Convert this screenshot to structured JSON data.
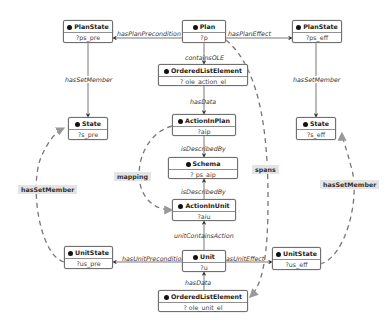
{
  "nodes": {
    "planstate_pre": {
      "title": "PlanState",
      "id": "?ps_pre"
    },
    "plan": {
      "title": "Plan",
      "id": "?p"
    },
    "planstate_eff": {
      "title": "PlanState",
      "id": "?ps_eff"
    },
    "ole_action": {
      "title": "OrderedListElement",
      "id": "? ole_action_el"
    },
    "state_pre": {
      "title": "State",
      "id": "?s_pre"
    },
    "action_in_plan": {
      "title": "ActionInPlan",
      "id": "?aip"
    },
    "state_eff": {
      "title": "State",
      "id": "?s_eff"
    },
    "schema": {
      "title": "Schema",
      "id": "? ps_aip"
    },
    "action_in_unit": {
      "title": "ActionInUnit",
      "id": "?aiu"
    },
    "unitstate_pre": {
      "title": "UnitState",
      "id": "?us_pre"
    },
    "unit": {
      "title": "Unit",
      "id": "?u"
    },
    "unitstate_eff": {
      "title": "UnitState",
      "id": "?us_eff"
    },
    "ole_unit": {
      "title": "OrderedListElement",
      "id": "? ole_unit_el"
    }
  },
  "edges": {
    "hasPlanPrecondition": "hasPlanPrecondition",
    "hasPlanEffect": "hasPlanEffect",
    "containsOLE": "containsOLE",
    "hasData_top": "hasData",
    "isDescribedBy_top": "isDescribedBy",
    "isDescribedBy_bottom": "isDescribedBy",
    "unitContainsAction": "unitContainsAction",
    "hasUnitPrecondition": "hasUnitPrecondition",
    "hasUnitEffect": "hasUnitEffect",
    "hasData_bottom": "hasData",
    "hasSetMember_left": "hasSetMember",
    "hasSetMember_right": "hasSetMember"
  },
  "dashed_labels": {
    "hasSetMember_left": "hasSetMember",
    "mapping": "mapping",
    "spans": "spans",
    "hasSetMember_right": "hasSetMember"
  }
}
